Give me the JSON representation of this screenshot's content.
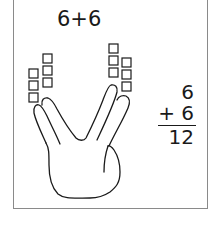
{
  "problem": {
    "title": "6+6",
    "addend1": "6",
    "operator_addend2": "+ 6",
    "sum": "12"
  },
  "blocks": {
    "left_hand_count": 6,
    "right_hand_count": 6
  },
  "colors": {
    "stroke": "#1a1a1a",
    "frame": "#8a8a8a",
    "background": "#ffffff"
  }
}
